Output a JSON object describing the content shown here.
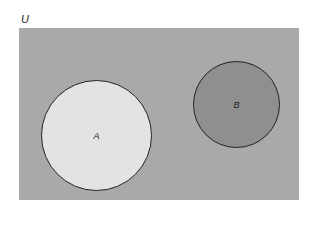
{
  "diagram": {
    "type": "venn",
    "universe": {
      "label": "U",
      "color": "#a9a9a9"
    },
    "sets": [
      {
        "label": "A",
        "color": "#e3e3e3",
        "overlaps": []
      },
      {
        "label": "B",
        "color": "#8f8f8f",
        "overlaps": []
      }
    ],
    "relationship": "disjoint"
  }
}
